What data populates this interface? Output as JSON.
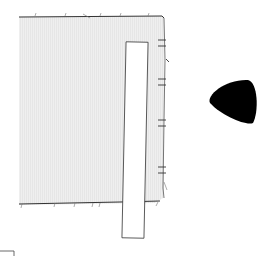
{
  "diagram": {
    "measure_labels": [
      {
        "text": "0.4 in [1 cm]",
        "y": 40
      },
      {
        "text": "2 in [5 cm]",
        "y": 59
      },
      {
        "text": "0.4 in [1 cm]",
        "y": 79
      },
      {
        "text": "2 in [5 cm]",
        "y": 99
      },
      {
        "text": "0.4 in [1 cm]",
        "y": 120
      },
      {
        "text": "2 in [5 cm]",
        "y": 143
      },
      {
        "text": "0.4 in [1 cm]",
        "y": 167
      }
    ],
    "tape_measure": {
      "numbers": [
        "0",
        "1",
        "2",
        "3",
        "4",
        "5",
        "6",
        "7",
        "8",
        "9",
        "10",
        "11",
        "12",
        "13",
        "14",
        "15",
        "16",
        "17",
        "18",
        "19",
        "20",
        "21",
        "22",
        "23",
        "24",
        "25",
        "26"
      ]
    },
    "chalk": {
      "shape": "rounded-triangle",
      "color": "#000000"
    },
    "colors": {
      "fabric": "#ededed",
      "outline": "#333333",
      "label": "#8a8a8a"
    }
  }
}
